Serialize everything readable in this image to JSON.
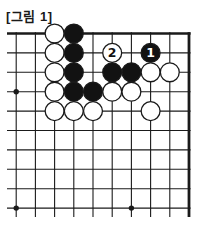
{
  "figure": {
    "label": "[그림 1]"
  },
  "board": {
    "type": "go-diagram",
    "description": "Top-right corner of a 19x19 Go board, 10x10 intersections visible; left and bottom sides are cut off",
    "visible_cols": 10,
    "visible_rows": 10,
    "thick_edges": [
      "top",
      "right"
    ],
    "star_points": [
      {
        "col": 1,
        "row": 4
      },
      {
        "col": 1,
        "row": 10
      },
      {
        "col": 7,
        "row": 10
      }
    ],
    "stones": [
      {
        "col": 3,
        "row": 1,
        "color": "white"
      },
      {
        "col": 4,
        "row": 1,
        "color": "black"
      },
      {
        "col": 3,
        "row": 2,
        "color": "white"
      },
      {
        "col": 4,
        "row": 2,
        "color": "black"
      },
      {
        "col": 6,
        "row": 2,
        "color": "white",
        "label": "2"
      },
      {
        "col": 8,
        "row": 2,
        "color": "black",
        "label": "1"
      },
      {
        "col": 3,
        "row": 3,
        "color": "white"
      },
      {
        "col": 4,
        "row": 3,
        "color": "black"
      },
      {
        "col": 6,
        "row": 3,
        "color": "black"
      },
      {
        "col": 7,
        "row": 3,
        "color": "black"
      },
      {
        "col": 8,
        "row": 3,
        "color": "white"
      },
      {
        "col": 9,
        "row": 3,
        "color": "white"
      },
      {
        "col": 3,
        "row": 4,
        "color": "white"
      },
      {
        "col": 4,
        "row": 4,
        "color": "black"
      },
      {
        "col": 5,
        "row": 4,
        "color": "black"
      },
      {
        "col": 6,
        "row": 4,
        "color": "white"
      },
      {
        "col": 7,
        "row": 4,
        "color": "white"
      },
      {
        "col": 3,
        "row": 5,
        "color": "white"
      },
      {
        "col": 4,
        "row": 5,
        "color": "white"
      },
      {
        "col": 5,
        "row": 5,
        "color": "white"
      },
      {
        "col": 8,
        "row": 5,
        "color": "white"
      }
    ],
    "colors": {
      "line": "#1a1a1a",
      "black_stone": "#121212",
      "white_stone": "#ffffff",
      "background": "#ffffff",
      "number_on_black": "#ffffff",
      "number_on_white": "#111111"
    }
  }
}
